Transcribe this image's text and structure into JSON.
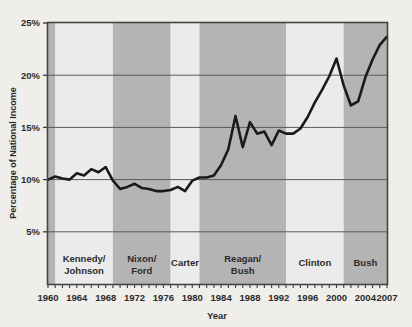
{
  "chart_data": {
    "type": "line",
    "title": "",
    "xlabel": "Year",
    "ylabel": "Percentage of National Income",
    "xlim": [
      1960,
      2007
    ],
    "ylim": [
      0,
      25
    ],
    "ytick_labels": [
      "5%",
      "10%",
      "15%",
      "20%",
      "25%"
    ],
    "ytick_values": [
      5,
      10,
      15,
      20,
      25
    ],
    "xtick_labels": [
      "1960",
      "1964",
      "1968",
      "1972",
      "1976",
      "1980",
      "1984",
      "1988",
      "1992",
      "1996",
      "2000",
      "2004",
      "2007"
    ],
    "xtick_values": [
      1960,
      1964,
      1968,
      1972,
      1976,
      1980,
      1984,
      1988,
      1992,
      1996,
      2000,
      2004,
      2007
    ],
    "minor_tick_interval": 1,
    "grid": "horizontal",
    "legend": "none",
    "line_color": "#1a1a1a",
    "line_width": 2.6,
    "band_color_shaded": "#b4b4b4",
    "band_color_light": "#ebebeb",
    "background_color": "#efeeea",
    "x": [
      1960,
      1961,
      1962,
      1963,
      1964,
      1965,
      1966,
      1967,
      1968,
      1969,
      1970,
      1971,
      1972,
      1973,
      1974,
      1975,
      1976,
      1977,
      1978,
      1979,
      1980,
      1981,
      1982,
      1983,
      1984,
      1985,
      1986,
      1987,
      1988,
      1989,
      1990,
      1991,
      1992,
      1993,
      1994,
      1995,
      1996,
      1997,
      1998,
      1999,
      2000,
      2001,
      2002,
      2003,
      2004,
      2005,
      2006,
      2007
    ],
    "values": [
      10.0,
      10.3,
      10.1,
      10.0,
      10.6,
      10.4,
      11.0,
      10.7,
      11.2,
      9.9,
      9.1,
      9.3,
      9.6,
      9.2,
      9.1,
      8.9,
      8.9,
      9.0,
      9.3,
      8.9,
      9.9,
      10.2,
      10.2,
      10.4,
      11.4,
      12.9,
      16.1,
      13.1,
      15.5,
      14.4,
      14.6,
      13.3,
      14.7,
      14.4,
      14.4,
      14.9,
      16.0,
      17.4,
      18.6,
      19.9,
      21.6,
      19.0,
      17.1,
      17.5,
      19.8,
      21.5,
      22.9,
      23.7
    ],
    "eras": [
      {
        "label_line1": "Kennedy/",
        "label_line2": "Johnson",
        "start": 1961,
        "end": 1969,
        "shaded": false
      },
      {
        "label_line1": "Nixon/",
        "label_line2": "Ford",
        "start": 1969,
        "end": 1977,
        "shaded": true
      },
      {
        "label_line1": "Carter",
        "label_line2": "",
        "start": 1977,
        "end": 1981,
        "shaded": false
      },
      {
        "label_line1": "Reagan/",
        "label_line2": "Bush",
        "start": 1981,
        "end": 1993,
        "shaded": true
      },
      {
        "label_line1": "Clinton",
        "label_line2": "",
        "start": 1993,
        "end": 2001,
        "shaded": false
      },
      {
        "label_line1": "Bush",
        "label_line2": "",
        "start": 2001,
        "end": 2007,
        "shaded": true
      }
    ],
    "leading_band": {
      "start": 1960,
      "end": 1961,
      "shaded": true
    }
  }
}
